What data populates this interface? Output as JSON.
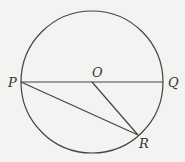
{
  "diagram": {
    "type": "geometry-circle",
    "circle": {
      "cx": 92,
      "cy": 82,
      "r": 71
    },
    "points": {
      "P": {
        "x": 21,
        "y": 82,
        "label": "P"
      },
      "O": {
        "x": 92,
        "y": 82,
        "label": "O"
      },
      "Q": {
        "x": 163,
        "y": 82,
        "label": "Q"
      },
      "R": {
        "x": 138,
        "y": 135,
        "label": "R"
      }
    },
    "segments": [
      {
        "from": "P",
        "to": "Q",
        "name": "diameter-PQ"
      },
      {
        "from": "P",
        "to": "R",
        "name": "chord-PR"
      },
      {
        "from": "O",
        "to": "R",
        "name": "radius-OR"
      }
    ],
    "colors": {
      "stroke": "#444444",
      "background": "#f3f3f1",
      "text": "#333333"
    }
  }
}
